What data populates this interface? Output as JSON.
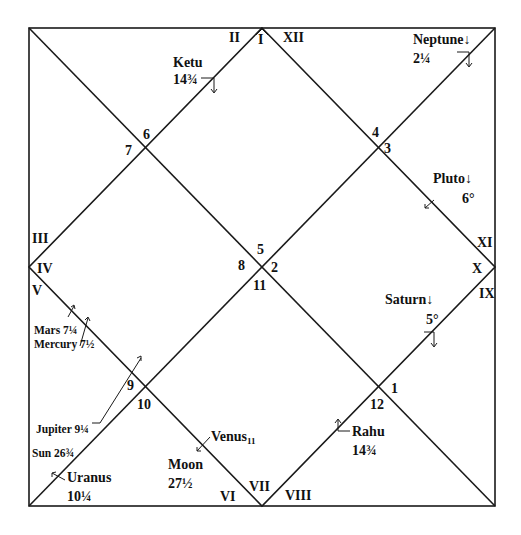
{
  "chart": {
    "type": "north-indian-horoscope",
    "houses_roman": [
      "I",
      "II",
      "III",
      "IV",
      "V",
      "VI",
      "VII",
      "VIII",
      "IX",
      "X",
      "XI",
      "XII"
    ],
    "sign_numbers": {
      "house_I": "5",
      "house_II": "6",
      "house_III": "7",
      "house_IV": "8",
      "house_V": "9",
      "house_VI": "10",
      "house_VII": "11",
      "house_VIII": "12",
      "house_IX": "1",
      "house_X": "2",
      "house_XI": "3",
      "house_XII": "4"
    },
    "planets": {
      "ketu": {
        "name": "Ketu",
        "degree": "14¾"
      },
      "neptune": {
        "name": "Neptune↓",
        "degree": "2¼"
      },
      "pluto": {
        "name": "Pluto↓",
        "degree": "6°"
      },
      "saturn": {
        "name": "Saturn↓",
        "degree": "5°"
      },
      "mars": {
        "name": "Mars 7¼"
      },
      "mercury": {
        "name": "Mercury 7½"
      },
      "jupiter": {
        "name": "Jupiter 9¼"
      },
      "sun": {
        "name": "Sun 26¾"
      },
      "uranus": {
        "name": "Uranus",
        "degree": "10¼"
      },
      "moon": {
        "name": "Moon",
        "degree": "27½"
      },
      "venus": {
        "name": "Venus",
        "sub": "11"
      },
      "rahu": {
        "name": "Rahu",
        "degree": "14¾"
      }
    },
    "line_color": "#1a1a1a"
  }
}
